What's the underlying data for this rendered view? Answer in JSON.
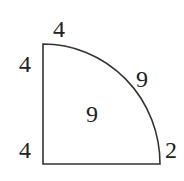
{
  "diagram": {
    "shape": "quarter-circle",
    "stroke_color": "#333333",
    "labels": {
      "top": "4",
      "left_upper": "4",
      "arc": "9",
      "center": "9",
      "left_lower": "4",
      "right_bottom": "2"
    }
  }
}
